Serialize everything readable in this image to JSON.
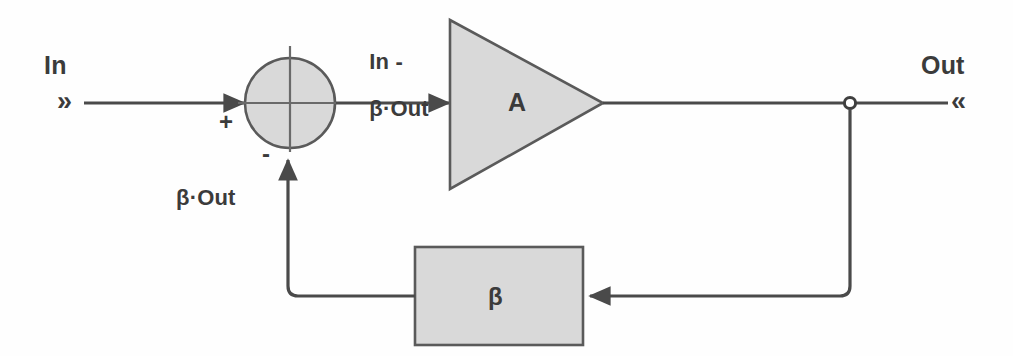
{
  "diagram": {
    "colors": {
      "stroke": "#4a4a4a",
      "shape_fill": "#d9d9d9",
      "shape_stroke": "#5a5a5a",
      "text": "#3b3b3b",
      "background": "#fefefe"
    },
    "input_port": {
      "label": "In",
      "marker": "»"
    },
    "output_port": {
      "label": "Out",
      "marker": "«"
    },
    "summing_junction": {
      "name": "summing-junction",
      "shape": "circle",
      "plus_sign": "+",
      "minus_sign": "-",
      "center_x": 290,
      "center_y": 103,
      "radius": 45
    },
    "error_signal_label": {
      "line1": "In -",
      "line2": "β·Out"
    },
    "amplifier": {
      "name": "amplifier-block",
      "shape": "triangle",
      "label": "A",
      "gain_meaning": "open-loop gain"
    },
    "feedback_block": {
      "name": "feedback-block",
      "shape": "rectangle",
      "label": "β",
      "meaning": "feedback fraction"
    },
    "feedback_signal_label": "β·Out"
  }
}
